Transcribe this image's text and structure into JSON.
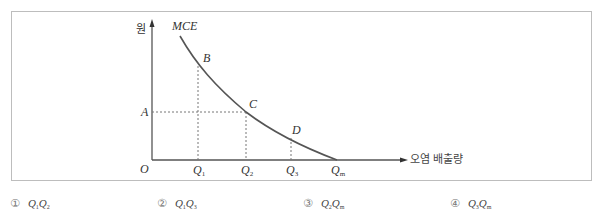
{
  "diagram": {
    "title": "MCE",
    "y_axis_label": "원",
    "x_axis_label": "오염 배출량",
    "origin_label": "O",
    "price_label": "A",
    "points": [
      {
        "name": "B"
      },
      {
        "name": "C"
      },
      {
        "name": "D"
      }
    ],
    "x_ticks": [
      {
        "base": "Q",
        "sub": "1"
      },
      {
        "base": "Q",
        "sub": "2"
      },
      {
        "base": "Q",
        "sub": "3"
      },
      {
        "base": "Q",
        "sub": "m"
      }
    ],
    "colors": {
      "curve": "#555555",
      "axis": "#555555",
      "dashed": "#777777",
      "frame": "#bdbdbd"
    }
  },
  "choices": [
    {
      "number": "①",
      "a": {
        "base": "Q",
        "sub": "1"
      },
      "b": {
        "base": "Q",
        "sub": "2"
      }
    },
    {
      "number": "②",
      "a": {
        "base": "Q",
        "sub": "1"
      },
      "b": {
        "base": "Q",
        "sub": "3"
      }
    },
    {
      "number": "③",
      "a": {
        "base": "Q",
        "sub": "2"
      },
      "b": {
        "base": "Q",
        "sub": "m"
      }
    },
    {
      "number": "④",
      "a": {
        "base": "Q",
        "sub": "3"
      },
      "b": {
        "base": "Q",
        "sub": "m"
      }
    }
  ]
}
